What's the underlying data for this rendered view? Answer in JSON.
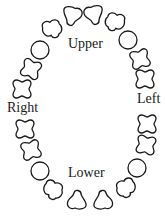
{
  "diagram": {
    "type": "dental-chart",
    "labels": {
      "upper": "Upper",
      "lower": "Lower",
      "right": "Right",
      "left": "Left"
    },
    "colors": {
      "outline": "#1a1a1a",
      "background": "#ffffff"
    },
    "upper_arch": {
      "tooth_count": 10,
      "teeth": [
        {
          "index": 1,
          "shape": "molar"
        },
        {
          "index": 2,
          "shape": "molar"
        },
        {
          "index": 3,
          "shape": "round"
        },
        {
          "index": 4,
          "shape": "premolar"
        },
        {
          "index": 5,
          "shape": "incisor"
        },
        {
          "index": 6,
          "shape": "incisor"
        },
        {
          "index": 7,
          "shape": "premolar"
        },
        {
          "index": 8,
          "shape": "round"
        },
        {
          "index": 9,
          "shape": "molar"
        },
        {
          "index": 10,
          "shape": "molar"
        }
      ]
    },
    "lower_arch": {
      "tooth_count": 10,
      "teeth": [
        {
          "index": 1,
          "shape": "molar"
        },
        {
          "index": 2,
          "shape": "molar"
        },
        {
          "index": 3,
          "shape": "round"
        },
        {
          "index": 4,
          "shape": "premolar"
        },
        {
          "index": 5,
          "shape": "incisor"
        },
        {
          "index": 6,
          "shape": "incisor"
        },
        {
          "index": 7,
          "shape": "premolar"
        },
        {
          "index": 8,
          "shape": "round"
        },
        {
          "index": 9,
          "shape": "molar"
        },
        {
          "index": 10,
          "shape": "molar"
        }
      ]
    }
  }
}
